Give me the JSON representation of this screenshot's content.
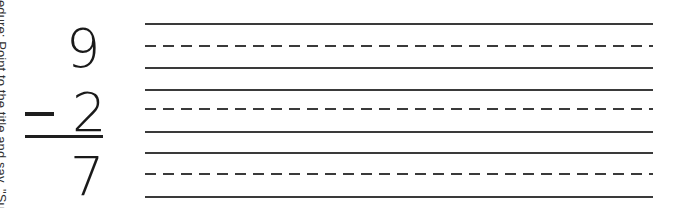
{
  "side_note": "edure: Point to the title and say, \"Subtra",
  "problem": {
    "minuend": "9",
    "operator": "−",
    "subtrahend": "2",
    "difference": "7"
  },
  "writing_lines": {
    "groups": 3,
    "pattern": [
      "solid",
      "dashed",
      "solid"
    ]
  }
}
